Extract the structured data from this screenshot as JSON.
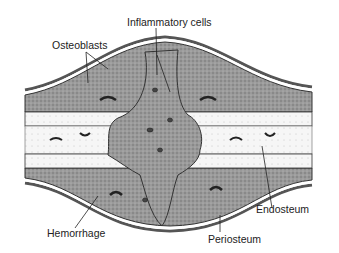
{
  "diagram": {
    "labels": {
      "inflammatory_cells": "Inflammatory cells",
      "osteoblasts": "Osteoblasts",
      "endosteum": "Endosteum",
      "hemorrhage": "Hemorrhage",
      "periosteum": "Periosteum"
    },
    "colors": {
      "background": "#ffffff",
      "tissue_dark": "#8a8a8a",
      "tissue_mid": "#a8a8a8",
      "bone_light": "#f4f4f4",
      "line": "#222222"
    }
  }
}
